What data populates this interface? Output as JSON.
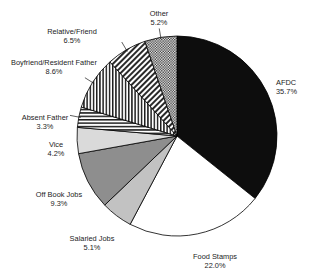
{
  "chart_data": {
    "type": "pie",
    "title": "",
    "start_angle_deg": 0,
    "direction": "clockwise",
    "units": "percent",
    "total": 100.0,
    "categories": [
      "AFDC",
      "Food Stamps",
      "Salaried Jobs",
      "Off Book Jobs",
      "Vice",
      "Absent Father",
      "Boyfriend/Resident Father",
      "Relative/Friend",
      "Other"
    ],
    "values": [
      35.7,
      22.0,
      5.1,
      9.3,
      4.2,
      3.3,
      8.6,
      6.5,
      5.2
    ],
    "slices": [
      {
        "label": "AFDC",
        "value": 35.7,
        "value_text": "35.7%",
        "fill": "solid-black",
        "color": "#0d0d0d"
      },
      {
        "label": "Food Stamps",
        "value": 22.0,
        "value_text": "22.0%",
        "fill": "solid-white",
        "color": "#ffffff"
      },
      {
        "label": "Salaried Jobs",
        "value": 5.1,
        "value_text": "5.1%",
        "fill": "solid-light-gray",
        "color": "#c2c2c2"
      },
      {
        "label": "Off Book Jobs",
        "value": 9.3,
        "value_text": "9.3%",
        "fill": "solid-dark-gray",
        "color": "#8e8e8e"
      },
      {
        "label": "Vice",
        "value": 4.2,
        "value_text": "4.2%",
        "fill": "solid-pale-gray",
        "color": "#dadada"
      },
      {
        "label": "Absent Father",
        "value": 3.3,
        "value_text": "3.3%",
        "fill": "horizontal-lines",
        "color": "#ffffff"
      },
      {
        "label": "Boyfriend/Resident Father",
        "value": 8.6,
        "value_text": "8.6%",
        "fill": "vertical-lines",
        "color": "#ffffff"
      },
      {
        "label": "Relative/Friend",
        "value": 6.5,
        "value_text": "6.5%",
        "fill": "diagonal-hatch",
        "color": "#ffffff"
      },
      {
        "label": "Other",
        "value": 5.2,
        "value_text": "5.2%",
        "fill": "checker",
        "color": "#ffffff"
      }
    ],
    "legend": "labels-outside-with-leader-lines",
    "grid": false,
    "background": "#ffffff",
    "outline_color": "#000000"
  }
}
